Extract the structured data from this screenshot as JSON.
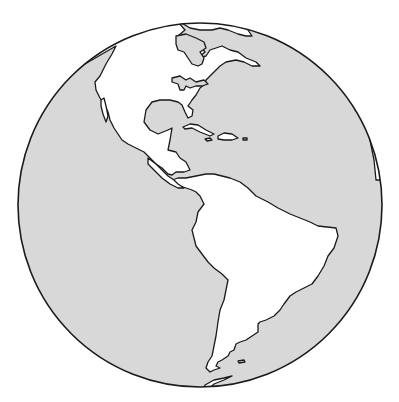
{
  "map": {
    "title": "Western Hemisphere globe",
    "projection": "orthographic",
    "center": [
      200,
      205
    ],
    "radius": 182,
    "colors": {
      "ocean": "#d8d8d8",
      "land": "#ffffff",
      "outline": "#1a1a1a",
      "background": "#ffffff"
    },
    "regions": [
      {
        "name": "North America"
      },
      {
        "name": "Greenland"
      },
      {
        "name": "Central America"
      },
      {
        "name": "Caribbean islands"
      },
      {
        "name": "South America"
      },
      {
        "name": "Falkland Islands"
      },
      {
        "name": "Antarctic Peninsula"
      },
      {
        "name": "West Africa edge"
      }
    ]
  }
}
